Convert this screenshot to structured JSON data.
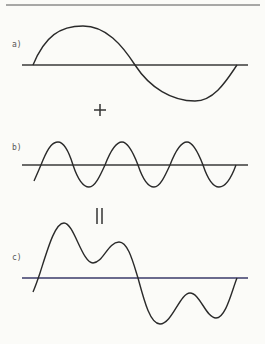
{
  "colors": {
    "background": "#fbfbf8",
    "stroke": "#2a2a2a",
    "axis": "#3a3a3a",
    "axis_c": "#3a3a6a",
    "label": "#555555"
  },
  "panels": [
    {
      "id": "a",
      "label": "a)",
      "description": "Fundamental sine wave, one full period"
    },
    {
      "id": "b",
      "label": "b)",
      "description": "Sine wave with three times the frequency, smaller amplitude"
    },
    {
      "id": "c",
      "label": "c)",
      "description": "Resulting wave: sum of a) and b)"
    }
  ],
  "operators": {
    "plus": "+",
    "equals": "="
  }
}
